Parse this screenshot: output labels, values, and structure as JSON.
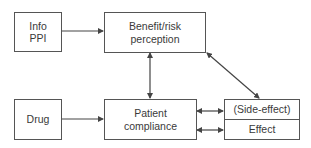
{
  "nodes": {
    "info": {
      "line1": "Info",
      "line2": "PPI"
    },
    "benefit": {
      "line1": "Benefit/risk",
      "line2": "perception"
    },
    "drug": {
      "label": "Drug"
    },
    "patient": {
      "line1": "Patient",
      "line2": "compliance"
    },
    "outcome": {
      "top": "(Side-effect)",
      "bottom": "Effect"
    }
  },
  "edges": [
    {
      "from": "info",
      "to": "benefit",
      "type": "arrow"
    },
    {
      "from": "drug",
      "to": "patient",
      "type": "arrow"
    },
    {
      "from": "benefit",
      "to": "patient",
      "type": "bidirectional"
    },
    {
      "from": "benefit",
      "to": "outcome",
      "type": "bidirectional"
    },
    {
      "from": "patient",
      "to": "outcome.top",
      "type": "bidirectional"
    },
    {
      "from": "patient",
      "to": "outcome.bottom",
      "type": "bidirectional"
    }
  ]
}
